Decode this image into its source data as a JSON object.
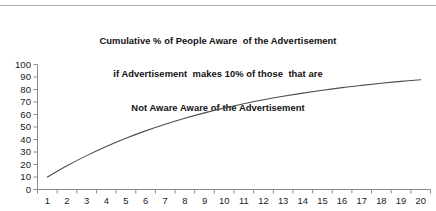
{
  "chart_data": {
    "type": "line",
    "title": "Cumulative % of People Aware  of the Advertisement\nif Advertisement  makes 10% of those  that are\nNot Aware Aware of the Advertisement",
    "title_lines": [
      "Cumulative % of People Aware  of the Advertisement",
      "if Advertisement  makes 10% of those  that are",
      "Not Aware Aware of the Advertisement"
    ],
    "xlabel": "",
    "ylabel": "",
    "xlim": [
      1,
      20
    ],
    "ylim": [
      0,
      100
    ],
    "grid": false,
    "legend": null,
    "line_color": "#4d4d4d",
    "axis_color": "#8c8c8c",
    "x": [
      1,
      2,
      3,
      4,
      5,
      6,
      7,
      8,
      9,
      10,
      11,
      12,
      13,
      14,
      15,
      16,
      17,
      18,
      19,
      20
    ],
    "xtick_labels": [
      "1",
      "2",
      "3",
      "4",
      "5",
      "6",
      "7",
      "8",
      "9",
      "10",
      "11",
      "12",
      "13",
      "14",
      "15",
      "16",
      "17",
      "18",
      "19",
      "20"
    ],
    "ytick_labels": [
      "100",
      "90",
      "80",
      "70",
      "60",
      "50",
      "40",
      "30",
      "20",
      "10",
      "0"
    ],
    "yticks": [
      100,
      90,
      80,
      70,
      60,
      50,
      40,
      30,
      20,
      10,
      0
    ],
    "series": [
      {
        "name": "Cumulative % Aware",
        "values": [
          10.0,
          19.0,
          27.1,
          34.4,
          41.0,
          46.9,
          52.2,
          57.0,
          61.3,
          65.1,
          68.6,
          71.8,
          74.6,
          77.1,
          79.4,
          81.5,
          83.3,
          85.0,
          86.5,
          87.8
        ]
      }
    ]
  }
}
